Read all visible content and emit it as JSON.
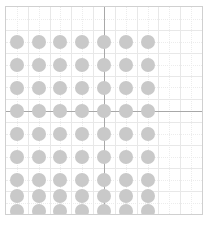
{
  "figure": {
    "name": "grid-scatter-plot",
    "width": 209,
    "height": 231,
    "background_color": "#ffffff"
  },
  "plot_area": {
    "left": 5,
    "top": 6,
    "width": 198,
    "height": 209,
    "border_color": "#d0d0d0"
  },
  "style": {
    "marker_color": "#c9c9c9",
    "marker_diameter": 14,
    "minor_grid_color": "#e8e8e8",
    "dotted_grid_color": "#ececec",
    "major_divider_color": "#a8a8a8"
  },
  "chart_data": {
    "type": "scatter",
    "title": "",
    "subtitle": "",
    "xlabel": "",
    "ylabel": "",
    "grid": true,
    "legend": null,
    "annotations": [],
    "xlim": [
      0,
      9
    ],
    "ylim": [
      0,
      9
    ],
    "xticks": [
      0,
      1,
      2,
      3,
      4,
      5,
      6,
      7,
      8,
      9
    ],
    "yticks": [
      0,
      1,
      2,
      3,
      4,
      5,
      6,
      7,
      8,
      9
    ],
    "xticklabels": [
      "",
      "",
      "",
      "",
      "",
      "",
      "",
      "",
      "",
      ""
    ],
    "yticklabels": [
      "",
      "",
      "",
      "",
      "",
      "",
      "",
      "",
      "",
      ""
    ],
    "major_divider_x": 4.5,
    "major_divider_y": 4.5,
    "minor_gridlines_x": [
      1,
      2,
      3,
      4,
      5,
      6,
      7,
      8
    ],
    "minor_gridlines_y": [
      1,
      2,
      3,
      4,
      5,
      6,
      7,
      8
    ],
    "dotted_gridlines_x": [
      0.5,
      1.5,
      2.5,
      3.5,
      4.5,
      5.5,
      6.5,
      7.5,
      8.5
    ],
    "dotted_gridlines_y": [
      0.5,
      1.5,
      2.5,
      3.5,
      4.5,
      5.5,
      6.5,
      7.5,
      8.5
    ],
    "series": [
      {
        "name": "points",
        "color": "#c9c9c9",
        "marker": "circle",
        "x": [
          0.5,
          1.5,
          2.5,
          3.5,
          4.5,
          5.5,
          6.5,
          0.5,
          1.5,
          2.5,
          3.5,
          4.5,
          5.5,
          6.5,
          0.5,
          1.5,
          2.5,
          3.5,
          4.5,
          5.5,
          6.5,
          0.5,
          1.5,
          2.5,
          3.5,
          4.5,
          5.5,
          6.5,
          0.5,
          1.5,
          2.5,
          3.5,
          4.5,
          5.5,
          6.5,
          0.5,
          1.5,
          2.5,
          3.5,
          4.5,
          5.5,
          6.5,
          0.5,
          1.5,
          2.5,
          3.5,
          4.5,
          5.5,
          6.5,
          0.5,
          1.5,
          2.5,
          3.5,
          4.5,
          5.5,
          6.5,
          0.5,
          1.5,
          2.5,
          3.5,
          4.5,
          5.5,
          6.5
        ],
        "y": [
          7.5,
          7.5,
          7.5,
          7.5,
          7.5,
          7.5,
          7.5,
          6.5,
          6.5,
          6.5,
          6.5,
          6.5,
          6.5,
          6.5,
          5.5,
          5.5,
          5.5,
          5.5,
          5.5,
          5.5,
          5.5,
          4.5,
          4.5,
          4.5,
          4.5,
          4.5,
          4.5,
          4.5,
          3.5,
          3.5,
          3.5,
          3.5,
          3.5,
          3.5,
          3.5,
          2.5,
          2.5,
          2.5,
          2.5,
          2.5,
          2.5,
          2.5,
          1.5,
          1.5,
          1.5,
          1.5,
          1.5,
          1.5,
          1.5,
          0.8,
          0.8,
          0.8,
          0.8,
          0.8,
          0.8,
          0.8,
          0.15,
          0.15,
          0.15,
          0.15,
          0.15,
          0.15,
          0.15
        ],
        "point_count": 63,
        "rows": 9,
        "columns": 7
      }
    ]
  }
}
